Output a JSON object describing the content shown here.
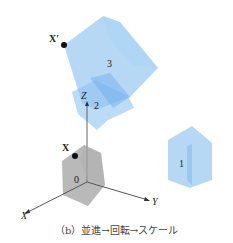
{
  "figure": {
    "caption": "（b）並進→回転→スケール",
    "axes": {
      "x": "X",
      "y": "Y",
      "z": "Z"
    },
    "points": [
      {
        "label": "X",
        "position": "original"
      },
      {
        "label": "X′",
        "position": "transformed"
      }
    ],
    "shapes": [
      {
        "id": "0",
        "label": "0",
        "color": "#888888",
        "description": "original gray house shape at origin"
      },
      {
        "id": "1",
        "label": "1",
        "color": "#8fc3f0",
        "description": "after translation"
      },
      {
        "id": "2",
        "label": "2",
        "color": "#8fc3f0",
        "description": "after rotation"
      },
      {
        "id": "3",
        "label": "3",
        "color": "#8fc3f0",
        "description": "after scale"
      }
    ],
    "colors": {
      "shape_blue": "#8fc3f0",
      "shape_gray": "#8a8a8a",
      "axis": "#555555"
    }
  }
}
